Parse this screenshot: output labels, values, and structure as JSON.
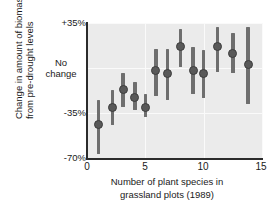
{
  "chart_data": {
    "type": "scatter",
    "title": "",
    "subtitle": "",
    "xlabel_lines": [
      "Number of plant species in",
      "grassland plots (1989)"
    ],
    "ylabel_lines": [
      "Change in amount of biomass",
      "from pre-drought levels"
    ],
    "xlabel": "Number of plant species in grassland plots (1989)",
    "ylabel": "Change in amount of biomass from pre-drought levels",
    "xlim": [
      0,
      15
    ],
    "ylim": [
      -70,
      35
    ],
    "xticks": [
      0,
      5,
      10,
      15
    ],
    "xtick_labels": [
      "0",
      "5",
      "10",
      "15"
    ],
    "yticks": [
      35,
      0,
      -35,
      -70
    ],
    "ytick_labels": [
      "+35%",
      "No change",
      "-35%",
      "-70%"
    ],
    "ytick_label_nochange_lines": [
      "No",
      "change"
    ],
    "grid": true,
    "legend": "none",
    "panel_color": "#ebebeb",
    "grid_color": "#fafafa",
    "marker_color": "#595959",
    "errorbar_color": "#6e6e6e",
    "axis_color": "#2b2b2b",
    "series": [
      {
        "name": "biomass change vs species richness",
        "points": [
          {
            "x": 1.0,
            "y": -44,
            "low": -67,
            "high": -25
          },
          {
            "x": 2.2,
            "y": -31,
            "low": -44,
            "high": -17
          },
          {
            "x": 3.1,
            "y": -17,
            "low": -30,
            "high": -4
          },
          {
            "x": 4.1,
            "y": -23,
            "low": -33,
            "high": -11
          },
          {
            "x": 5.0,
            "y": -31,
            "low": -38,
            "high": -20
          },
          {
            "x": 5.9,
            "y": -2,
            "low": -22,
            "high": 15
          },
          {
            "x": 6.9,
            "y": -4,
            "low": -25,
            "high": 15
          },
          {
            "x": 8.0,
            "y": 17,
            "low": 1,
            "high": 30
          },
          {
            "x": 9.1,
            "y": -2,
            "low": -20,
            "high": 16
          },
          {
            "x": 10.0,
            "y": -4,
            "low": -23,
            "high": 14
          },
          {
            "x": 11.2,
            "y": 17,
            "low": -3,
            "high": 32
          },
          {
            "x": 12.5,
            "y": 11,
            "low": -4,
            "high": 27
          },
          {
            "x": 13.8,
            "y": 3,
            "low": -28,
            "high": 32
          }
        ]
      }
    ]
  }
}
